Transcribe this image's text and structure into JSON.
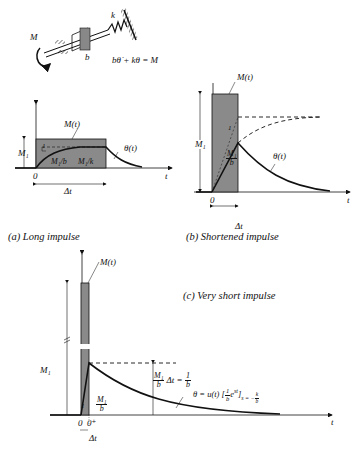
{
  "system_sketch": {
    "moment_label": "M",
    "damper_label": "b",
    "spring_label": "k",
    "equation": "bθ̇ + kθ = M"
  },
  "panels": [
    {
      "id": "a",
      "caption": "(a)  Long impulse",
      "labels": {
        "input": "M(t)",
        "response": "θ(t)",
        "amplitude": "M₁",
        "origin": "0",
        "time_axis": "t",
        "duration": "Δt",
        "slope_num": "1",
        "slope": "M₁/b",
        "steady": "M₁/k"
      }
    },
    {
      "id": "b",
      "caption": "(b)  Shortened impulse",
      "labels": {
        "input": "M(t)",
        "response": "θ(t)",
        "amplitude": "M₁",
        "origin": "0",
        "time_axis": "t",
        "duration": "Δt",
        "slope_num": "1",
        "slope_top": "M₁",
        "slope_bottom": "b"
      }
    },
    {
      "id": "c",
      "caption": "(c)  Very short impulse",
      "labels": {
        "input": "M(t)",
        "amplitude": "M₁",
        "origin": "0",
        "origin_plus": "0⁺",
        "time_axis": "t",
        "duration": "Δt",
        "slope_num": "1",
        "slope_top": "M₁",
        "slope_bottom": "b",
        "jump_lhs_top": "M₁",
        "jump_lhs_bottom": "b",
        "jump_mid": "Δt =",
        "jump_rhs_top": "1",
        "jump_rhs_bottom": "b",
        "response_eq": "θ = u(t) [",
        "response_eq_frac_top": "1",
        "response_eq_frac_bottom": "b",
        "response_eq_exp": "e",
        "response_eq_sup": "st",
        "response_eq_close": "]",
        "response_eq_sub": "s = −",
        "response_eq_sub_top": "k",
        "response_eq_sub_bottom": "b"
      }
    }
  ],
  "colors": {
    "ink": "#111111",
    "pulse_fill": "#8a8a8a",
    "background": "#ffffff"
  }
}
